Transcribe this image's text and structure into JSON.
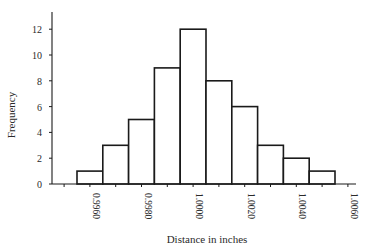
{
  "chart_data": {
    "type": "bar",
    "subtype": "histogram",
    "title": "",
    "xlabel": "Distance in inches",
    "ylabel": "Frequency",
    "bin_width": 0.0005,
    "bins": [
      {
        "start": 0.9955,
        "end": 0.996,
        "count": 1
      },
      {
        "start": 0.996,
        "end": 0.9965,
        "count": 3
      },
      {
        "start": 0.9965,
        "end": 0.997,
        "count": 5
      },
      {
        "start": 0.997,
        "end": 0.9975,
        "count": 9
      },
      {
        "start": 0.9975,
        "end": 0.998,
        "count": 12
      },
      {
        "start": 0.998,
        "end": 0.9985,
        "count": 8
      },
      {
        "start": 0.9985,
        "end": 0.999,
        "count": 6
      },
      {
        "start": 0.999,
        "end": 0.9995,
        "count": 3
      },
      {
        "start": 0.9995,
        "end": 1.0,
        "count": 2
      },
      {
        "start": 1.0,
        "end": 1.0005,
        "count": 1
      }
    ],
    "values": [
      1,
      3,
      5,
      9,
      12,
      8,
      6,
      3,
      2,
      1
    ],
    "total": 50,
    "x_tick_labels": [
      "0.9960",
      "0.9980",
      "1.0000",
      "1.0020",
      "1.0040",
      "1.0060"
    ],
    "y_ticks": [
      0,
      2,
      4,
      6,
      8,
      10,
      12
    ],
    "ylim": [
      0,
      13
    ],
    "grid": false,
    "legend": null
  }
}
